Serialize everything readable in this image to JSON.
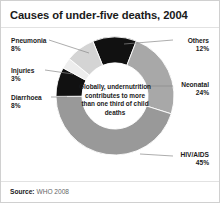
{
  "card": {
    "title": "Causes of under-five deaths, 2004",
    "source_label": "Source:",
    "source_value": "WHO 2008"
  },
  "center_caption": "Globally, undernutrition contributes to more than one third of child deaths",
  "chart_data": {
    "type": "pie",
    "title": "Causes of under-five deaths, 2004",
    "subtitle": "",
    "xlabel": "",
    "ylabel": "",
    "legend_position": "callout-labels",
    "donut": true,
    "inner_radius_ratio": 0.56,
    "start_angle_deg": -22,
    "categories": [
      "Others",
      "Neonatal",
      "HIV/AIDS",
      "Diarrhoea",
      "Injuries",
      "Pneumonia"
    ],
    "values": [
      12,
      24,
      45,
      8,
      3,
      8
    ],
    "unit": "%",
    "colors": [
      "#111111",
      "#a8a8a8",
      "#999999",
      "#111111",
      "#ededed",
      "#d4d4d4"
    ],
    "annotation": "Globally, undernutrition contributes to more than one third of child deaths",
    "slices": [
      {
        "name": "Others",
        "value": 12,
        "value_text": "12%",
        "color": "#111111"
      },
      {
        "name": "Neonatal",
        "value": 24,
        "value_text": "24%",
        "color": "#a8a8a8"
      },
      {
        "name": "HIV/AIDS",
        "value": 45,
        "value_text": "45%",
        "color": "#999999"
      },
      {
        "name": "Diarrhoea",
        "value": 8,
        "value_text": "8%",
        "color": "#111111"
      },
      {
        "name": "Injuries",
        "value": 3,
        "value_text": "3%",
        "color": "#ededed"
      },
      {
        "name": "Pneumonia",
        "value": 8,
        "value_text": "8%",
        "color": "#d4d4d4"
      }
    ]
  },
  "labels": {
    "pneumonia": {
      "name": "Pneumonia",
      "pct": "8%"
    },
    "injuries": {
      "name": "Injuries",
      "pct": "3%"
    },
    "diarrhoea": {
      "name": "Diarrhoea",
      "pct": "8%"
    },
    "others": {
      "name": "Others",
      "pct": "12%"
    },
    "neonatal": {
      "name": "Neonatal",
      "pct": "24%"
    },
    "hivaids": {
      "name": "HIV/AIDS",
      "pct": "45%"
    }
  }
}
